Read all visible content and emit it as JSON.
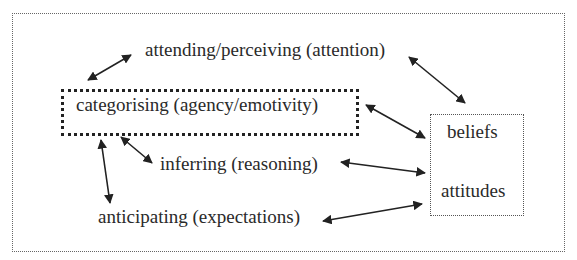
{
  "diagram": {
    "nodes": {
      "attending": "attending/perceiving (attention)",
      "categorising": "categorising (agency/emotivity)",
      "inferring": "inferring (reasoning)",
      "anticipating": "anticipating (expectations)",
      "beliefs": "beliefs",
      "attitudes": "attitudes"
    },
    "edges": [
      {
        "from": "attending",
        "to": "categorising",
        "type": "bidirectional"
      },
      {
        "from": "attending",
        "to": "beliefs-attitudes",
        "type": "bidirectional"
      },
      {
        "from": "categorising",
        "to": "beliefs-attitudes",
        "type": "bidirectional"
      },
      {
        "from": "inferring",
        "to": "beliefs-attitudes",
        "type": "bidirectional"
      },
      {
        "from": "anticipating",
        "to": "beliefs-attitudes",
        "type": "bidirectional"
      },
      {
        "from": "categorising",
        "to": "anticipating",
        "type": "bidirectional"
      },
      {
        "from": "categorising",
        "to": "inferring",
        "type": "bidirectional"
      }
    ]
  }
}
